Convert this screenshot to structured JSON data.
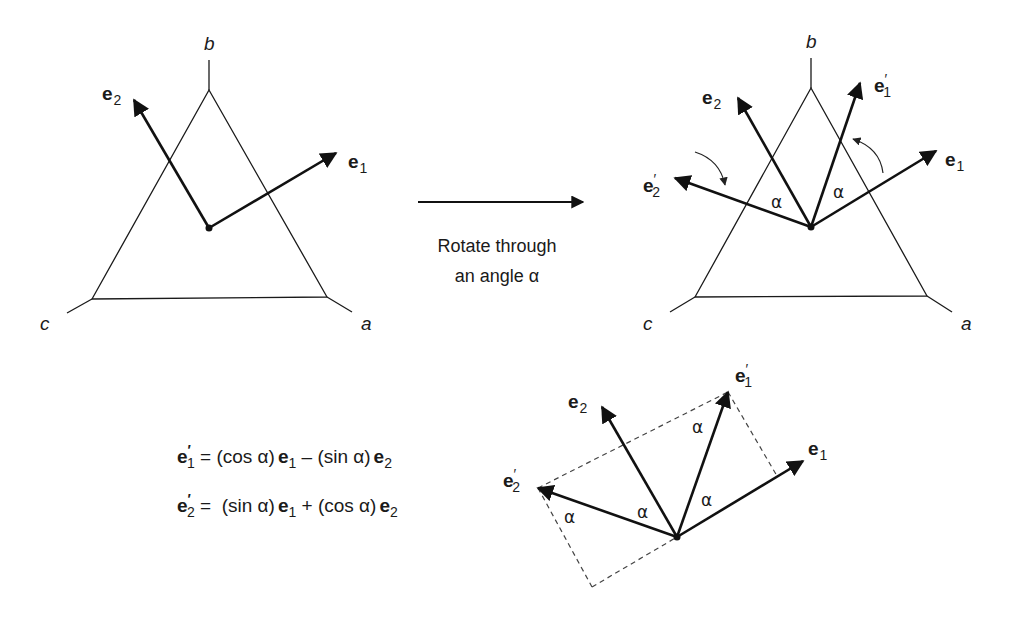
{
  "left_diagram": {
    "vertex_labels": {
      "b": "b",
      "c": "c",
      "a": "a"
    },
    "vectors": [
      {
        "name": "e",
        "sub": "1",
        "prime": ""
      },
      {
        "name": "e",
        "sub": "2",
        "prime": ""
      }
    ]
  },
  "transition": {
    "line1": "Rotate through",
    "line2": "an angle α"
  },
  "right_diagram": {
    "vertex_labels": {
      "b": "b",
      "c": "c",
      "a": "a"
    },
    "vectors": [
      {
        "name": "e",
        "sub": "2",
        "prime": ""
      },
      {
        "name": "e",
        "sub": "1",
        "prime": "′"
      },
      {
        "name": "e",
        "sub": "1",
        "prime": ""
      },
      {
        "name": "e",
        "sub": "2",
        "prime": "′"
      }
    ],
    "angle_label": "α"
  },
  "equations": [
    {
      "lhs": {
        "name": "e",
        "prime": "′",
        "sub": "1"
      },
      "eq": " = ",
      "t1": "(cos α)",
      "v1": {
        "name": "e",
        "sub": "1"
      },
      "op": " – ",
      "t2": "(sin α)",
      "v2": {
        "name": "e",
        "sub": "2"
      }
    },
    {
      "lhs": {
        "name": "e",
        "prime": "′",
        "sub": "2"
      },
      "eq": " =  ",
      "t1": "(sin α)",
      "v1": {
        "name": "e",
        "sub": "1"
      },
      "op": " + ",
      "t2": "(cos α)",
      "v2": {
        "name": "e",
        "sub": "2"
      }
    }
  ],
  "bottom_diagram": {
    "vectors": [
      {
        "name": "e",
        "sub": "2",
        "prime": ""
      },
      {
        "name": "e",
        "sub": "1",
        "prime": "′"
      },
      {
        "name": "e",
        "sub": "1",
        "prime": ""
      },
      {
        "name": "e",
        "sub": "2",
        "prime": "′"
      }
    ],
    "angle_label": "α"
  }
}
